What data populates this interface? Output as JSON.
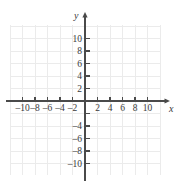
{
  "figure": {
    "kind": "cartesian-coordinate-grid",
    "width": 178,
    "height": 185,
    "background_color": "#ffffff",
    "grid_color": "#ebebeb",
    "axis_color": "#4a4a4a",
    "label_color": "#3a3a3a"
  },
  "chart_data": {
    "type": "scatter",
    "title": "",
    "subtitle": "",
    "xlabel": "x",
    "ylabel": "y",
    "xlim": [
      -12,
      12
    ],
    "ylim": [
      -12,
      12
    ],
    "grid": true,
    "grid_step": 1,
    "tick_step": 2,
    "legend": null,
    "series": [],
    "values": [],
    "x": [],
    "annotations": [],
    "x_tick_values": [
      -10,
      -8,
      -6,
      -4,
      -2,
      2,
      4,
      6,
      8,
      10
    ],
    "x_tick_labels": [
      "–10",
      "–8",
      "–6",
      "–4",
      "–2",
      "2",
      "4",
      "6",
      "8",
      "10"
    ],
    "y_tick_values": [
      10,
      8,
      6,
      4,
      2,
      -2,
      -4,
      -6,
      -8,
      -10
    ],
    "y_tick_labels": [
      "10",
      "8",
      "6",
      "4",
      "2",
      "",
      "–4",
      "–6",
      "–8",
      "–10"
    ],
    "origin_label": "",
    "axis_arrows": [
      "x-positive",
      "y-positive"
    ],
    "note": "Empty coordinate plane with no plotted data"
  },
  "axis_names": {
    "x": "x",
    "y": "y"
  }
}
